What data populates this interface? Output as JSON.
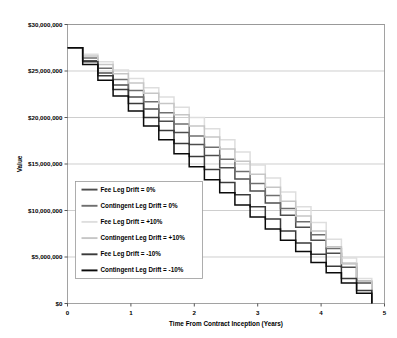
{
  "chart_data": {
    "type": "line",
    "title": "",
    "xlabel": "Time From Contract Inception (Years)",
    "ylabel": "Value",
    "xlim": [
      0,
      5
    ],
    "ylim": [
      0,
      30000000
    ],
    "xticks": [
      0,
      1,
      2,
      3,
      4,
      5
    ],
    "xtick_labels": [
      "0",
      "1",
      "2",
      "3",
      "4",
      "5"
    ],
    "yticks": [
      0,
      5000000,
      10000000,
      15000000,
      20000000,
      25000000,
      30000000
    ],
    "ytick_labels": [
      "$0",
      "$5,000,000",
      "$10,000,000",
      "$15,000,000",
      "$20,000,000",
      "$25,000,000",
      "$30,000,000"
    ],
    "grid": "horizontal",
    "legend_position": "lower-left-inside",
    "step_style": "post",
    "step_count": 20,
    "series": [
      {
        "name": "Fee Leg Drift = 0%",
        "color": "#4d4d4d",
        "x": [
          0,
          0.24,
          0.48,
          0.72,
          0.96,
          1.2,
          1.44,
          1.68,
          1.92,
          2.16,
          2.4,
          2.64,
          2.88,
          3.12,
          3.36,
          3.6,
          3.84,
          4.08,
          4.32,
          4.56,
          4.8
        ],
        "values": [
          27500000,
          26100000,
          24800000,
          23500000,
          22200000,
          20900000,
          19600000,
          18400000,
          17100000,
          15900000,
          14600000,
          13400000,
          12100000,
          10800000,
          9500000,
          8200000,
          6800000,
          5400000,
          3900000,
          2200000,
          0
        ]
      },
      {
        "name": "Contingent Leg Drift = 0%",
        "color": "#6f6f6f",
        "x": [
          0,
          0.24,
          0.48,
          0.72,
          0.96,
          1.2,
          1.44,
          1.68,
          1.92,
          2.16,
          2.4,
          2.64,
          2.88,
          3.12,
          3.36,
          3.6,
          3.84,
          4.08,
          4.32,
          4.56,
          4.8
        ],
        "values": [
          27500000,
          26400000,
          25300000,
          24100000,
          22900000,
          21700000,
          20500000,
          19300000,
          18000000,
          16800000,
          15500000,
          14200000,
          12900000,
          11600000,
          10200000,
          8800000,
          7400000,
          5900000,
          4300000,
          2400000,
          0
        ]
      },
      {
        "name": "Fee Leg Drift = +10%",
        "color": "#dedede",
        "x": [
          0,
          0.24,
          0.48,
          0.72,
          0.96,
          1.2,
          1.44,
          1.68,
          1.92,
          2.16,
          2.4,
          2.64,
          2.88,
          3.12,
          3.36,
          3.6,
          3.84,
          4.08,
          4.32,
          4.56,
          4.8
        ],
        "values": [
          27500000,
          26800000,
          26000000,
          25100000,
          24200000,
          23200000,
          22200000,
          21100000,
          20000000,
          18800000,
          17600000,
          16300000,
          14900000,
          13500000,
          12000000,
          10400000,
          8700000,
          6900000,
          4900000,
          2700000,
          0
        ]
      },
      {
        "name": "Contingent Leg Drift = +10%",
        "color": "#c6c6c6",
        "x": [
          0,
          0.24,
          0.48,
          0.72,
          0.96,
          1.2,
          1.44,
          1.68,
          1.92,
          2.16,
          2.4,
          2.64,
          2.88,
          3.12,
          3.36,
          3.6,
          3.84,
          4.08,
          4.32,
          4.56,
          4.8
        ],
        "values": [
          27500000,
          26600000,
          25700000,
          24700000,
          23700000,
          22600000,
          21500000,
          20300000,
          19100000,
          17900000,
          16600000,
          15300000,
          13900000,
          12500000,
          11000000,
          9400000,
          7800000,
          6100000,
          4300000,
          2400000,
          0
        ]
      },
      {
        "name": "Fee Leg Drift = -10%",
        "color": "#3a3a3a",
        "x": [
          0,
          0.24,
          0.48,
          0.72,
          0.96,
          1.2,
          1.44,
          1.68,
          1.92,
          2.16,
          2.4,
          2.64,
          2.88,
          3.12,
          3.36,
          3.6,
          3.84,
          4.08,
          4.32,
          4.56,
          4.8
        ],
        "values": [
          27500000,
          26000000,
          24500000,
          23000000,
          21500000,
          20000000,
          18600000,
          17200000,
          15800000,
          14400000,
          13000000,
          11700000,
          10400000,
          9100000,
          7800000,
          6500000,
          5300000,
          4000000,
          2700000,
          1400000,
          0
        ]
      },
      {
        "name": "Contingent Leg Drift = -10%",
        "color": "#0a0a0a",
        "x": [
          0,
          0.24,
          0.48,
          0.72,
          0.96,
          1.2,
          1.44,
          1.68,
          1.92,
          2.16,
          2.4,
          2.64,
          2.88,
          3.12,
          3.36,
          3.6,
          3.84,
          4.08,
          4.32,
          4.56,
          4.8
        ],
        "values": [
          27500000,
          25700000,
          24000000,
          22300000,
          20700000,
          19100000,
          17600000,
          16100000,
          14700000,
          13300000,
          11900000,
          10600000,
          9300000,
          8000000,
          6800000,
          5600000,
          4400000,
          3300000,
          2200000,
          1100000,
          0
        ]
      }
    ]
  }
}
